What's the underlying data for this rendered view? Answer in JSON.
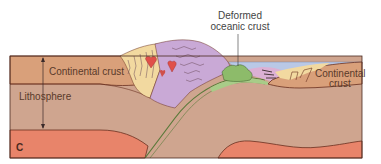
{
  "diagram": {
    "panel_letter": "C",
    "labels": {
      "continental_crust_left": "Continental crust",
      "lithosphere": "Lithosphere",
      "continental_crust_right_line1": "Continental",
      "continental_crust_right_line2": "crust",
      "deformed_line1": "Deformed",
      "deformed_line2": "oceanic crust"
    },
    "colors": {
      "continental_crust": "#d9a07a",
      "lithosphere": "#cfa58f",
      "asthenosphere": "#e8846a",
      "ocean": "#b9c8e6",
      "deformed_oceanic_crust": "#8dbb6a",
      "mountain_sediments_yellow": "#f2d9a0",
      "mountain_purple": "#c9a9d6",
      "magma": "#e0504a",
      "sediment_wedge_pink": "#dcb0d4",
      "border": "#4a2a20"
    }
  }
}
